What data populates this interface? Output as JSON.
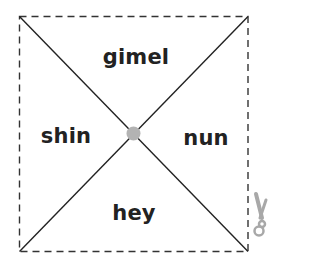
{
  "diagram": {
    "type": "folded-square-template",
    "colors": {
      "line": "#222222",
      "dashed_border": "#333333",
      "center_dot": "#b0b0b0",
      "scissors": "#a8a8a8",
      "text": "#222222"
    },
    "sections": {
      "top": "gimel",
      "left": "shin",
      "right": "nun",
      "bottom": "hey"
    },
    "icons": {
      "center": "center-dot",
      "cut": "scissors-icon"
    }
  }
}
